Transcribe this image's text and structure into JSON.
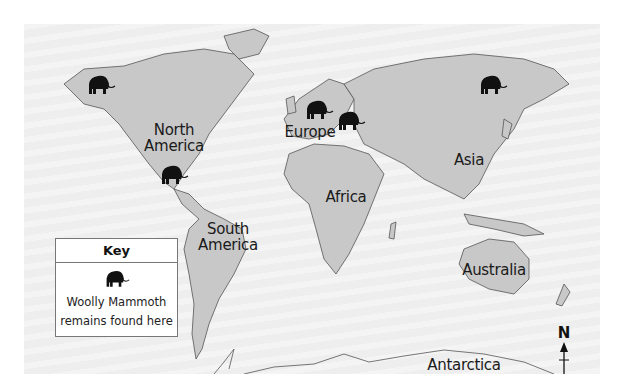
{
  "map": {
    "labels": {
      "north_america": "North\nAmerica",
      "south_america": "South\nAmerica",
      "europe": "Europe",
      "africa": "Africa",
      "asia": "Asia",
      "australia": "Australia",
      "antarctica": "Antarctica"
    },
    "mammoth_markers": [
      {
        "region": "Alaska",
        "x": 62,
        "y": 50
      },
      {
        "region": "Mexico",
        "x": 135,
        "y": 140
      },
      {
        "region": "Northern Europe",
        "x": 280,
        "y": 75
      },
      {
        "region": "Eastern Europe",
        "x": 312,
        "y": 86
      },
      {
        "region": "Siberia",
        "x": 454,
        "y": 50
      }
    ],
    "colors": {
      "ocean": "#eeeeee",
      "land": "#c8c8c8",
      "outline": "#555555",
      "marker": "#111111"
    }
  },
  "key": {
    "title": "Key",
    "icon": "mammoth-icon",
    "line1": "Woolly Mammoth",
    "line2": "remains found here"
  },
  "compass": {
    "label": "N"
  }
}
